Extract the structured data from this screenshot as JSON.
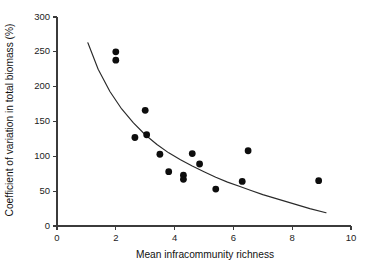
{
  "chart_data": {
    "type": "scatter",
    "title": "",
    "xlabel": "Mean infracommunity richness",
    "ylabel": "Coefficient of variation in total biomass (%)",
    "xlim": [
      0,
      10
    ],
    "ylim": [
      0,
      300
    ],
    "xticks": [
      0,
      2,
      4,
      6,
      8,
      10
    ],
    "yticks": [
      0,
      50,
      100,
      150,
      200,
      250,
      300
    ],
    "xtick_labels": [
      "0",
      "2",
      "4",
      "6",
      "8",
      "10"
    ],
    "ytick_labels": [
      "0",
      "50",
      "100",
      "150",
      "200",
      "250",
      "300"
    ],
    "grid": false,
    "legend": null,
    "marker": "filled-circle",
    "marker_color": "#0d0d0d",
    "curve_color": "#2a2a2a",
    "points": [
      {
        "x": 2.0,
        "y": 250
      },
      {
        "x": 2.0,
        "y": 238
      },
      {
        "x": 2.65,
        "y": 127
      },
      {
        "x": 3.0,
        "y": 166
      },
      {
        "x": 3.05,
        "y": 131
      },
      {
        "x": 3.5,
        "y": 103
      },
      {
        "x": 3.8,
        "y": 78
      },
      {
        "x": 4.3,
        "y": 73
      },
      {
        "x": 4.3,
        "y": 67
      },
      {
        "x": 4.6,
        "y": 104
      },
      {
        "x": 4.85,
        "y": 89
      },
      {
        "x": 5.4,
        "y": 53
      },
      {
        "x": 6.3,
        "y": 64
      },
      {
        "x": 6.5,
        "y": 108
      },
      {
        "x": 8.9,
        "y": 65
      }
    ],
    "fitted_curve": {
      "label": "fitted decay curve",
      "x_range": [
        1.05,
        9.15
      ],
      "points": [
        {
          "x": 1.05,
          "y": 263
        },
        {
          "x": 1.4,
          "y": 225
        },
        {
          "x": 1.8,
          "y": 193
        },
        {
          "x": 2.2,
          "y": 168
        },
        {
          "x": 2.6,
          "y": 148
        },
        {
          "x": 3.0,
          "y": 131
        },
        {
          "x": 3.4,
          "y": 117
        },
        {
          "x": 3.8,
          "y": 105
        },
        {
          "x": 4.2,
          "y": 95
        },
        {
          "x": 4.6,
          "y": 86
        },
        {
          "x": 5.0,
          "y": 78
        },
        {
          "x": 5.4,
          "y": 70
        },
        {
          "x": 5.8,
          "y": 63
        },
        {
          "x": 6.2,
          "y": 57
        },
        {
          "x": 6.6,
          "y": 51
        },
        {
          "x": 7.0,
          "y": 45
        },
        {
          "x": 7.4,
          "y": 40
        },
        {
          "x": 7.8,
          "y": 35
        },
        {
          "x": 8.2,
          "y": 30
        },
        {
          "x": 8.6,
          "y": 25
        },
        {
          "x": 9.15,
          "y": 19
        }
      ]
    }
  }
}
